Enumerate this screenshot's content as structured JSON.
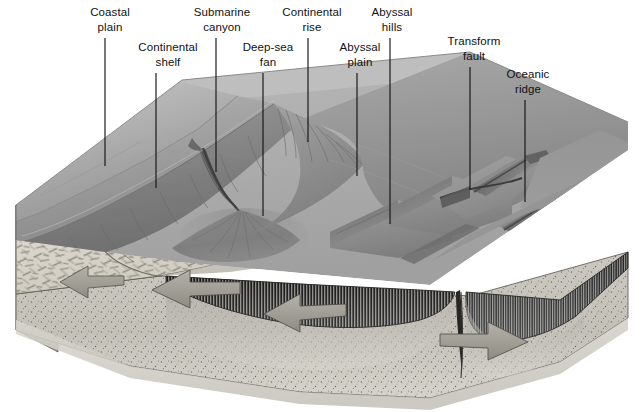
{
  "figure": {
    "type": "geologic-block-diagram",
    "background_color": "#ffffff",
    "ink_color": "#141414"
  },
  "labels": [
    {
      "id": "coastal-plain",
      "line1": "Coastal",
      "line2": "plain",
      "text_x": 110,
      "text_y1": 16,
      "text_y2": 31,
      "leader_x": 105,
      "leader_y_top": 38,
      "leader_y_bottom": 166
    },
    {
      "id": "continental-shelf",
      "line1": "Continental",
      "line2": "shelf",
      "text_x": 168,
      "text_y1": 51,
      "text_y2": 66,
      "leader_x": 156,
      "leader_y_top": 73,
      "leader_y_bottom": 188
    },
    {
      "id": "submarine-canyon",
      "line1": "Submarine",
      "line2": "canyon",
      "text_x": 222,
      "text_y1": 16,
      "text_y2": 31,
      "leader_x": 216,
      "leader_y_top": 38,
      "leader_y_bottom": 172
    },
    {
      "id": "deep-sea-fan",
      "line1": "Deep-sea",
      "line2": "fan",
      "text_x": 268,
      "text_y1": 51,
      "text_y2": 66,
      "leader_x": 263,
      "leader_y_top": 73,
      "leader_y_bottom": 216
    },
    {
      "id": "continental-rise",
      "line1": "Continental",
      "line2": "rise",
      "text_x": 312,
      "text_y1": 16,
      "text_y2": 31,
      "leader_x": 308,
      "leader_y_top": 38,
      "leader_y_bottom": 142
    },
    {
      "id": "abyssal-plain",
      "line1": "Abyssal",
      "line2": "plain",
      "text_x": 360,
      "text_y1": 51,
      "text_y2": 66,
      "leader_x": 357,
      "leader_y_top": 73,
      "leader_y_bottom": 176
    },
    {
      "id": "abyssal-hills",
      "line1": "Abyssal",
      "line2": "hills",
      "text_x": 392,
      "text_y1": 16,
      "text_y2": 31,
      "leader_x": 390,
      "leader_y_top": 38,
      "leader_y_bottom": 224
    },
    {
      "id": "transform-fault",
      "line1": "Transform",
      "line2": "fault",
      "text_x": 474,
      "text_y1": 45,
      "text_y2": 60,
      "leader_x": 470,
      "leader_y_top": 67,
      "leader_y_bottom": 190
    },
    {
      "id": "oceanic-ridge",
      "line1": "Oceanic",
      "line2": "ridge",
      "text_x": 528,
      "text_y1": 78,
      "text_y2": 93,
      "leader_x": 525,
      "leader_y_top": 100,
      "leader_y_bottom": 202
    }
  ],
  "block": {
    "name": "ocean-basin-block",
    "top_surface_label": "seafloor-and-coastal-topography",
    "front_face_label": "front-cross-section",
    "left_face_label": "left-cross-section",
    "layers": [
      {
        "id": "continental-crust",
        "name": "Continental crust",
        "pattern": "dash-hatch",
        "color": "#ded9cf"
      },
      {
        "id": "oceanic-crust",
        "name": "Oceanic crust",
        "pattern": "vertical-dikes",
        "color": "#3a3a3a"
      },
      {
        "id": "mantle",
        "name": "Mantle",
        "pattern": "stipple",
        "color": "#cfccc4"
      },
      {
        "id": "magma-chamber",
        "name": "Magma upwelling",
        "pattern": "gradient",
        "color": "#b9b6ae"
      }
    ],
    "arrows": [
      {
        "id": "plate-motion-arrow-1",
        "direction": "left",
        "x": 52,
        "y": 288
      },
      {
        "id": "plate-motion-arrow-2",
        "direction": "left",
        "x": 165,
        "y": 292
      },
      {
        "id": "plate-motion-arrow-3",
        "direction": "left",
        "x": 290,
        "y": 310
      },
      {
        "id": "plate-motion-arrow-4",
        "direction": "right",
        "x": 440,
        "y": 342
      }
    ]
  },
  "features": [
    {
      "id": "coastal-plain-feature",
      "name": "Coastal plain"
    },
    {
      "id": "continental-shelf-feature",
      "name": "Continental shelf"
    },
    {
      "id": "continental-slope-feature",
      "name": "Continental slope"
    },
    {
      "id": "submarine-canyon-feature",
      "name": "Submarine canyon"
    },
    {
      "id": "deep-sea-fan-feature",
      "name": "Deep-sea fan"
    },
    {
      "id": "continental-rise-feature",
      "name": "Continental rise"
    },
    {
      "id": "abyssal-plain-feature",
      "name": "Abyssal plain"
    },
    {
      "id": "abyssal-hills-feature",
      "name": "Abyssal hills"
    },
    {
      "id": "transform-fault-feature",
      "name": "Transform fault"
    },
    {
      "id": "oceanic-ridge-feature",
      "name": "Oceanic ridge"
    },
    {
      "id": "rift-valley-feature",
      "name": "Rift valley"
    }
  ]
}
